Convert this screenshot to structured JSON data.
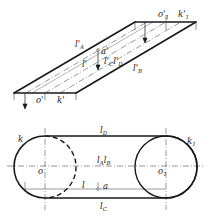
{
  "diagram": {
    "type": "engineering-projection",
    "colors": {
      "stroke": "#1a1a1a",
      "thin": "#444444",
      "background": "#ffffff"
    },
    "top_view": {
      "description": "oblique/front projection of a belt plane (parallelogram)",
      "labels": {
        "o1_prime": {
          "base": "o'",
          "sub": "1"
        },
        "k1_prime": {
          "base": "k'",
          "sub": "1"
        },
        "lA_prime": {
          "base": "l'",
          "sub": "A"
        },
        "a_prime": {
          "base": "a'"
        },
        "l_prime": {
          "base": "l'"
        },
        "lC_prime": {
          "base": "l'",
          "sub": "C"
        },
        "lD_prime": {
          "base": "l'",
          "sub": "D"
        },
        "lB_prime": {
          "base": "l'",
          "sub": "B"
        },
        "o_prime": {
          "base": "o'"
        },
        "k_prime": {
          "base": "k'"
        }
      }
    },
    "bottom_view": {
      "description": "plan view of belt around two circles (stadium shape)",
      "labels": {
        "lD": {
          "base": "l",
          "sub": "D"
        },
        "k": {
          "base": "k"
        },
        "k1": {
          "base": "k",
          "sub": "1"
        },
        "lA": {
          "base": "l",
          "sub": "A"
        },
        "lB": {
          "base": "l",
          "sub": "B"
        },
        "o": {
          "base": "o"
        },
        "o1": {
          "base": "o",
          "sub": "1"
        },
        "l": {
          "base": "l"
        },
        "a": {
          "base": "a"
        },
        "lC": {
          "base": "l",
          "sub": "C"
        }
      }
    }
  }
}
